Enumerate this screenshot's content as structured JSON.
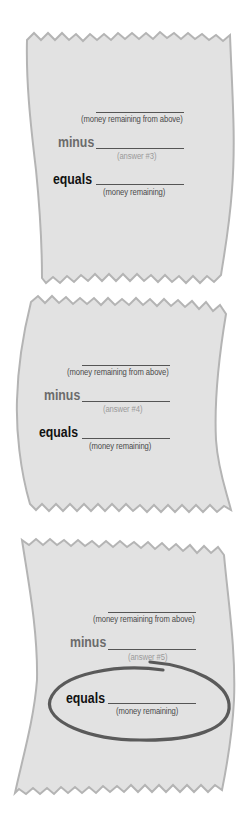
{
  "colors": {
    "paper_fill": "#e2e2e2",
    "paper_edge": "#b4b4b4",
    "oval_stroke": "#5a5a5a",
    "minus_text": "#6b6b6b",
    "equals_text": "#111111",
    "caption_text": "#4a4a4a",
    "faint_caption_text": "#9a9a9a"
  },
  "receipts": [
    {
      "top_caption": "(money remaining from above)",
      "minus_label": "minus",
      "minus_caption": "(answer #3)",
      "equals_label": "equals",
      "equals_caption": "(money remaining)",
      "circled": false
    },
    {
      "top_caption": "(money remaining from above)",
      "minus_label": "minus",
      "minus_caption": "(answer #4)",
      "equals_label": "equals",
      "equals_caption": "(money remaining)",
      "circled": false
    },
    {
      "top_caption": "(money remaining from above)",
      "minus_label": "minus",
      "minus_caption": "(answer #5)",
      "equals_label": "equals",
      "equals_caption": "(money remaining)",
      "circled": true
    }
  ]
}
